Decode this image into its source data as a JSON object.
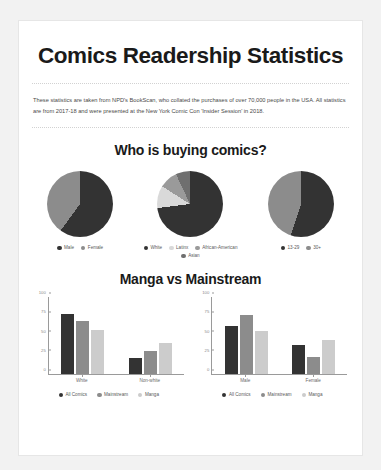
{
  "page": {
    "title": "Comics Readership Statistics",
    "intro": "These statistics are taken from NPD's BookScan, who collated the purchases of over 70,000 people in the USA. All statistics are from 2017-18 and were presented at the New York Comic Con 'Insider Session' in 2018."
  },
  "sections": [
    {
      "heading": "Who is buying comics?"
    },
    {
      "heading": "Manga vs Mainstream"
    }
  ],
  "colors": {
    "dark": "#333333",
    "mid": "#888888",
    "light": "#cccccc",
    "midlight": "#a8a8a8",
    "card": "#ffffff",
    "background": "#f2f2f2",
    "text": "#1a1a1a",
    "muted": "#5a5a5a"
  },
  "chart_data": [
    {
      "type": "pie",
      "title": "Gender",
      "labels": [
        "Male",
        "Female"
      ],
      "values": [
        60,
        40
      ],
      "colors": [
        "#333333",
        "#8c8c8c"
      ],
      "legend_position": "bottom"
    },
    {
      "type": "pie",
      "title": "Ethnicity",
      "labels": [
        "White",
        "Latinx",
        "African-American",
        "Asian"
      ],
      "values": [
        73,
        11,
        9,
        7
      ],
      "colors": [
        "#333333",
        "#d9d9d9",
        "#9a9a9a",
        "#6f6f6f"
      ],
      "legend_position": "bottom"
    },
    {
      "type": "pie",
      "title": "Age",
      "labels": [
        "13-29",
        "30+"
      ],
      "values": [
        55,
        45
      ],
      "colors": [
        "#333333",
        "#8c8c8c"
      ],
      "legend_position": "bottom"
    },
    {
      "type": "bar",
      "title": "Manga vs Mainstream by ethnicity",
      "categories": [
        "White",
        "Non-white"
      ],
      "series": [
        {
          "name": "All Comics",
          "values": [
            78,
            21
          ],
          "color": "#333333"
        },
        {
          "name": "Mainstream",
          "values": [
            69,
            30
          ],
          "color": "#8c8c8c"
        },
        {
          "name": "Manga",
          "values": [
            58,
            40
          ],
          "color": "#cccccc"
        }
      ],
      "yticks": [
        100,
        75,
        50,
        25,
        0
      ],
      "ylim": [
        0,
        100
      ],
      "grid": false,
      "legend_position": "bottom"
    },
    {
      "type": "bar",
      "title": "Manga vs Mainstream by gender",
      "categories": [
        "Male",
        "Female"
      ],
      "series": [
        {
          "name": "All Comics",
          "values": [
            63,
            38
          ],
          "color": "#333333"
        },
        {
          "name": "Mainstream",
          "values": [
            77,
            22
          ],
          "color": "#8c8c8c"
        },
        {
          "name": "Manga",
          "values": [
            56,
            44
          ],
          "color": "#cccccc"
        }
      ],
      "yticks": [
        100,
        75,
        50,
        25,
        0
      ],
      "ylim": [
        0,
        100
      ],
      "grid": false,
      "legend_position": "bottom"
    }
  ]
}
